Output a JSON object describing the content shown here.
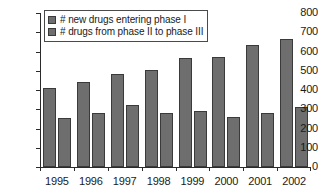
{
  "chart_data": {
    "type": "bar",
    "title": "",
    "xlabel": "",
    "ylabel": "",
    "ylim": [
      0,
      800
    ],
    "ytick_step": 100,
    "yticks": [
      "800",
      "700",
      "600",
      "500",
      "400",
      "300",
      "200",
      "100",
      "0"
    ],
    "grid": false,
    "legend_position": "top-left",
    "categories": [
      "1995",
      "1996",
      "1997",
      "1998",
      "1999",
      "2000",
      "2001",
      "2002"
    ],
    "series": [
      {
        "name": "# new drugs entering phase I",
        "color": "#6e6e6e",
        "values": [
          410,
          442,
          483,
          503,
          566,
          570,
          634,
          665
        ]
      },
      {
        "name": "# drugs from phase II to phase III",
        "color": "#6e6e6e",
        "values": [
          257,
          281,
          322,
          279,
          291,
          262,
          281,
          312
        ]
      }
    ]
  },
  "legend": {
    "items": [
      {
        "label": "# new drugs entering phase I"
      },
      {
        "label": "# drugs from phase II to phase III"
      }
    ]
  },
  "colors": {
    "bar_fill": "#6e6e6e",
    "bar_stroke": "#3a3a3a",
    "axis": "#2b2b2b",
    "background": "#ffffff",
    "text": "#1a1a1a"
  }
}
